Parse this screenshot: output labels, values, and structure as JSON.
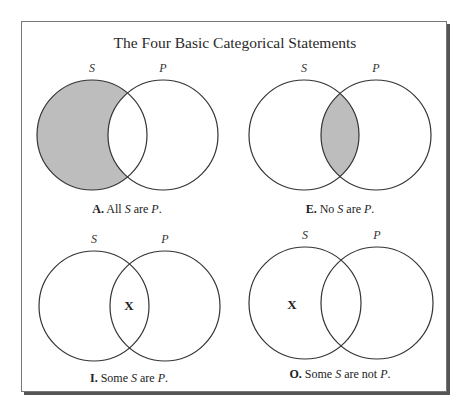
{
  "title": "The Four Basic Categorical Statements",
  "colors": {
    "shade": "#bdbdbd",
    "stroke": "#333333",
    "frame": "#777777"
  },
  "diagrams": [
    {
      "id": "A",
      "labels": {
        "s": "S",
        "p": "P"
      },
      "shaded_region": "S-only",
      "x_region": null,
      "caption": {
        "letter": "A.",
        "pre": "All",
        "s": "S",
        "mid": "are",
        "p": "P",
        "end": "."
      }
    },
    {
      "id": "E",
      "labels": {
        "s": "S",
        "p": "P"
      },
      "shaded_region": "intersection",
      "x_region": null,
      "caption": {
        "letter": "E.",
        "pre": "No",
        "s": "S",
        "mid": "are",
        "p": "P",
        "end": "."
      }
    },
    {
      "id": "I",
      "labels": {
        "s": "S",
        "p": "P"
      },
      "shaded_region": null,
      "x_region": "intersection",
      "x_mark": "X",
      "caption": {
        "letter": "I.",
        "pre": "Some",
        "s": "S",
        "mid": "are",
        "p": "P",
        "end": "."
      }
    },
    {
      "id": "O",
      "labels": {
        "s": "S",
        "p": "P"
      },
      "shaded_region": null,
      "x_region": "S-only",
      "x_mark": "X",
      "caption": {
        "letter": "O.",
        "pre": "Some",
        "s": "S",
        "mid": "are not",
        "p": "P",
        "end": "."
      }
    }
  ]
}
